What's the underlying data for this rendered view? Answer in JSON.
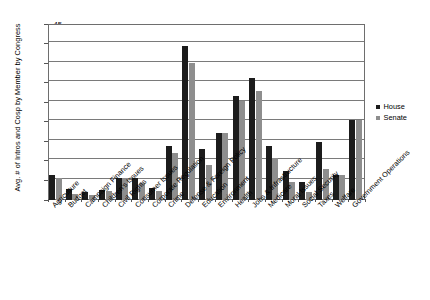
{
  "chart_data": {
    "type": "bar",
    "title": "",
    "xlabel": "",
    "ylabel": "Avg. # of Intros and Cosp by Member by Congress",
    "ylim": [
      0,
      45
    ],
    "ytick_interval": 5,
    "yticks": [
      0,
      5,
      10,
      15,
      20,
      25,
      30,
      35,
      40,
      45
    ],
    "grid": "horizontal",
    "legend_position": "right",
    "categories": [
      "Agriculture",
      "Budget",
      "Campaign Finance",
      "Children's Issues",
      "Civil Rights",
      "Consumer Issues",
      "Corporate Regulation",
      "Crime",
      "Defense & Foreign Policy",
      "Education",
      "Environment",
      "Health",
      "Jobs & Infrastructure",
      "Medicare",
      "Moral Issues",
      "Social Security",
      "Taxes",
      "Welfare",
      "Government Operations"
    ],
    "series": [
      {
        "name": "House",
        "color": "#1c1c1c",
        "values": [
          6.2,
          2.7,
          1.8,
          2.4,
          5.6,
          5.4,
          2.9,
          13.8,
          39.3,
          13.0,
          17.0,
          26.4,
          31.0,
          13.8,
          7.2,
          4.5,
          14.8,
          6.2,
          20.3
        ]
      },
      {
        "name": "Senate",
        "color": "#8e8e8e",
        "values": [
          5.5,
          1.5,
          1.2,
          2.3,
          5.6,
          4.1,
          2.2,
          11.8,
          34.8,
          8.8,
          17.0,
          25.2,
          27.8,
          10.6,
          4.5,
          1.8,
          7.8,
          6.2,
          20.3
        ]
      }
    ]
  },
  "legend": {
    "entries": [
      {
        "label": "House",
        "color": "#1c1c1c"
      },
      {
        "label": "Senate",
        "color": "#8e8e8e"
      }
    ]
  }
}
